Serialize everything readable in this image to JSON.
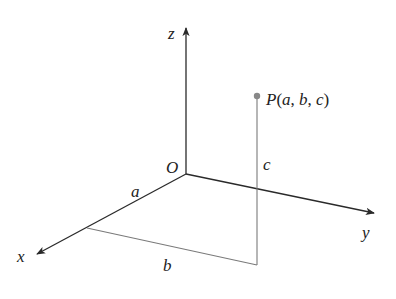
{
  "diagram": {
    "colors": {
      "axis": "#2a2a2a",
      "guide": "#7a7a7a",
      "point": "#888888",
      "text": "#222222"
    },
    "axes": {
      "x_label": "x",
      "y_label": "y",
      "z_label": "z",
      "origin_label": "O"
    },
    "point": {
      "label": "P(a, b, c)",
      "label_P": "P",
      "label_open": "(",
      "label_a": "a",
      "label_comma1": ", ",
      "label_b": "b",
      "label_comma2": ", ",
      "label_c": "c",
      "label_close": ")"
    },
    "segments": {
      "a_label": "a",
      "b_label": "b",
      "c_label": "c"
    }
  }
}
